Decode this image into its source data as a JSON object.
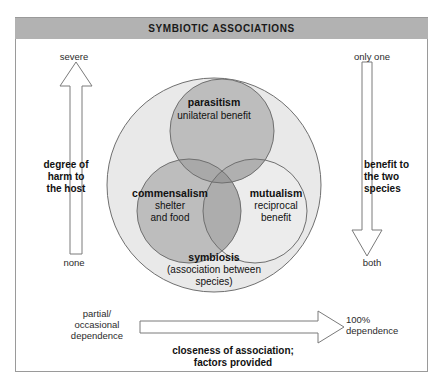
{
  "header": {
    "title": "SYMBIOTIC ASSOCIATIONS"
  },
  "axes": {
    "left": {
      "name": "degree of\nharm to\nthe host",
      "top_label": "severe",
      "bottom_label": "none",
      "direction": "up"
    },
    "right": {
      "name": "benefit to\nthe two\nspecies",
      "top_label": "only one",
      "bottom_label": "both",
      "direction": "down"
    },
    "bottom": {
      "name": "closeness of association;\nfactors provided",
      "start_label": "partial/\noccasional\ndependence",
      "end_label": "100%\ndependence",
      "direction": "right"
    }
  },
  "venn": {
    "outer": {
      "title": "symbiosis",
      "subtitle": "(association between\nspecies)"
    },
    "circles": [
      {
        "id": "parasitism",
        "title": "parasitism",
        "subtitle": "unilateral benefit",
        "shade": "dark"
      },
      {
        "id": "commensalism",
        "title": "commensalism",
        "subtitle": "shelter\nand food",
        "shade": "dark"
      },
      {
        "id": "mutualism",
        "title": "mutualism",
        "subtitle": "reciprocal\nbenefit",
        "shade": "light"
      }
    ]
  },
  "colors": {
    "header_bar": "#b2b2b2",
    "frame_border": "#9a9a9a",
    "circle_light": "#e9e9e9",
    "circle_dark": "#bdbdbd",
    "circle_overlap": "#a8a8a8",
    "circle_stroke": "#6f6f6f",
    "arrow_stroke": "#7a7a7a",
    "text": "#111111"
  }
}
